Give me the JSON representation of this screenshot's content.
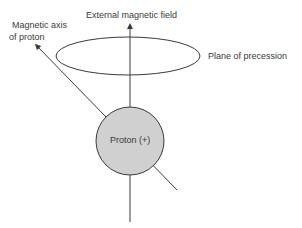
{
  "labels": {
    "field": "External magnetic field",
    "axis_line1": "Magnetic axis",
    "axis_line2": "of proton",
    "plane": "Plane of precession",
    "proton": "Proton (+)"
  },
  "colors": {
    "stroke": "#3a3a3a",
    "proton_fill": "#d0d0d0"
  }
}
